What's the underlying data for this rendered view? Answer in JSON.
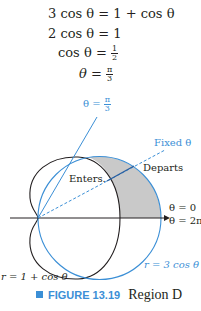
{
  "equations": {
    "line1": {
      "lhs": "3 cos θ",
      "rhs": "1 + cos θ"
    },
    "line2": {
      "lhs": "2 cos θ",
      "rhs": "1"
    },
    "line3": {
      "lhs": "cos θ",
      "rhs_num": "1",
      "rhs_den": "2"
    },
    "line4": {
      "lhs": "θ",
      "rhs_num": "π",
      "rhs_den": "3"
    }
  },
  "figure": {
    "label_theta_pi3": "θ = ",
    "label_theta_pi3_num": "π",
    "label_theta_pi3_den": "3",
    "label_fixed_theta": "Fixed θ",
    "label_enters": "Enters.",
    "label_departs": "Departs",
    "label_theta0": "θ = 0",
    "label_theta2pi": "θ = 2π",
    "label_circle": "r = 3 cos θ",
    "label_cardioid": "r = 1 + cos θ",
    "colors": {
      "accent": "#3b8fd6",
      "curve": "#231f20",
      "shade": "#c9c9c9"
    }
  },
  "caption": {
    "figure_number": "FIGURE 13.19",
    "title": "Region D"
  }
}
